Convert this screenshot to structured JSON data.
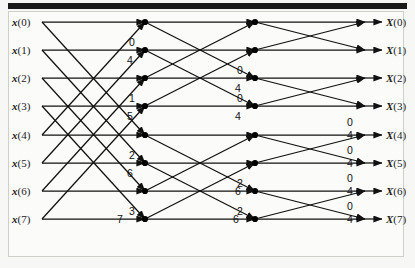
{
  "figure": {
    "kind": "fft-butterfly-signal-flow-graph",
    "title": "",
    "radix": 2,
    "npoints": 8,
    "stages": 3
  },
  "inputs": {
    "labels": [
      "x(0)",
      "x(1)",
      "x(2)",
      "x(3)",
      "x(4)",
      "x(5)",
      "x(6)",
      "x(7)"
    ]
  },
  "outputs": {
    "labels": [
      "X(0)",
      "X(1)",
      "X(2)",
      "X(3)",
      "X(4)",
      "X(5)",
      "X(6)",
      "X(7)"
    ]
  },
  "twiddle_labels": {
    "stage1": [
      "0",
      "4",
      "1",
      "5",
      "2",
      "6",
      "3",
      "7"
    ],
    "stage2": [
      "0",
      "4",
      "0",
      "4",
      "2",
      "6",
      "2",
      "6"
    ],
    "stage3": [
      "0",
      "4",
      "0",
      "4",
      "0",
      "4",
      "0",
      "4"
    ]
  },
  "geometry": {
    "rows_y": [
      22,
      50,
      78,
      106,
      135,
      163,
      191,
      219
    ],
    "col_input_x": 42,
    "col_stage1_x": 145,
    "col_stage2_x": 255,
    "col_stage3_x": 365,
    "col_output_x": 380
  },
  "colors": {
    "line": "#111111",
    "node": "#000000",
    "panel": "#fbfbf9",
    "page": "#f7f7f5",
    "topbar": "#1a1a1a",
    "border": "#cfcfc9",
    "text": "#1a1a1a"
  },
  "stage1_pairs": [
    [
      0,
      4
    ],
    [
      1,
      5
    ],
    [
      2,
      6
    ],
    [
      3,
      7
    ]
  ],
  "stage2_pairs": [
    [
      0,
      2
    ],
    [
      1,
      3
    ],
    [
      4,
      6
    ],
    [
      5,
      7
    ]
  ],
  "stage3_pairs": [
    [
      0,
      1
    ],
    [
      2,
      3
    ],
    [
      4,
      5
    ],
    [
      6,
      7
    ]
  ]
}
